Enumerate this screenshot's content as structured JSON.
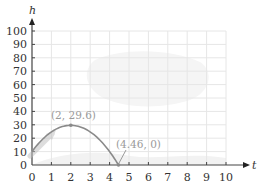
{
  "chart_data": {
    "type": "line",
    "title": "",
    "xlabel": "t",
    "ylabel": "h",
    "xlim": [
      0,
      10
    ],
    "ylim": [
      0,
      100
    ],
    "x_ticks": [
      0,
      1,
      2,
      3,
      4,
      5,
      6,
      7,
      8,
      9,
      10
    ],
    "y_ticks": [
      0,
      10,
      20,
      30,
      40,
      50,
      60,
      70,
      80,
      90,
      100
    ],
    "grid": true,
    "legend": null,
    "series": [
      {
        "name": "h(t) = -4.9t^2 + 19.6t + 10",
        "x": [
          0,
          0.5,
          1,
          1.5,
          2,
          2.5,
          3,
          3.5,
          4,
          4.46
        ],
        "y": [
          10,
          18.6,
          24.7,
          28.4,
          29.6,
          28.4,
          24.7,
          18.6,
          10,
          0
        ],
        "color": "#8a8a8a"
      }
    ],
    "annotations": [
      {
        "label": "(2, 29.6)",
        "x": 2,
        "y": 29.6,
        "kind": "vertex"
      },
      {
        "label": "(4.46, 0)",
        "x": 4.46,
        "y": 0,
        "kind": "root"
      }
    ]
  },
  "axes": {
    "x_label": "t",
    "y_label": "h",
    "x_tick_labels": [
      "0",
      "1",
      "2",
      "3",
      "4",
      "5",
      "6",
      "7",
      "8",
      "9",
      "10"
    ],
    "y_tick_labels": [
      "0",
      "10",
      "20",
      "30",
      "40",
      "50",
      "60",
      "70",
      "80",
      "90",
      "100"
    ]
  },
  "annotations": {
    "vertex_label": "(2, 29.6)",
    "root_label": "(4.46, 0)"
  },
  "colors": {
    "curve": "#8a8a8a",
    "grid": "#e6e6e6",
    "axis": "#444444",
    "annotation": "#9a9a9a",
    "shading": "#f2f2f2"
  }
}
